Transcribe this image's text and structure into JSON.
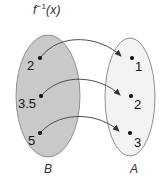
{
  "diagram": {
    "title": {
      "base": "f",
      "exponent": "−1",
      "argument": "(x)",
      "full": "f⁻¹(x)"
    },
    "type": "mapping-diagram",
    "colors": {
      "domain_fill": "#c9c9c9",
      "codomain_fill": "#f2f2f2",
      "ellipse_stroke": "#8c8c8c",
      "arrow_stroke": "#4d4d4d",
      "point_fill": "#111111",
      "text": "#111111",
      "background": "#ffffff"
    },
    "sets": [
      {
        "name": "B",
        "role": "domain",
        "label": "B",
        "elements": [
          {
            "label": "2",
            "cx": 40,
            "cy": 58
          },
          {
            "label": "3.5",
            "cx": 41,
            "cy": 96
          },
          {
            "label": "5",
            "cx": 40,
            "cy": 133
          }
        ]
      },
      {
        "name": "A",
        "role": "codomain",
        "label": "A",
        "elements": [
          {
            "label": "1",
            "cx": 132,
            "cy": 58
          },
          {
            "label": "2",
            "cx": 131,
            "cy": 96
          },
          {
            "label": "3",
            "cx": 130,
            "cy": 133
          }
        ]
      }
    ],
    "mappings": [
      {
        "from": "2",
        "to": "1"
      },
      {
        "from": "3.5",
        "to": "2"
      },
      {
        "from": "5",
        "to": "3"
      }
    ]
  }
}
